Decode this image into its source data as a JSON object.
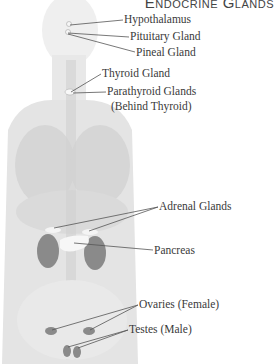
{
  "title": "Endocrine Glands",
  "labels": {
    "hypothalamus": "Hypothalamus",
    "pituitary": "Pituitary Gland",
    "pineal": "Pineal Gland",
    "thyroid": "Thyroid Gland",
    "parathyroid_line1": "Parathyroid Glands",
    "parathyroid_line2": "(Behind Thyroid)",
    "adrenal": "Adrenal Glands",
    "pancreas": "Pancreas",
    "ovaries": "Ovaries (Female)",
    "testes": "Testes (Male)"
  },
  "colors": {
    "organ_fill": "#8a8a8a",
    "gland_highlight": "#f4f4f4",
    "leader_line": "#555555",
    "body_shade": "#e6e6e6"
  }
}
